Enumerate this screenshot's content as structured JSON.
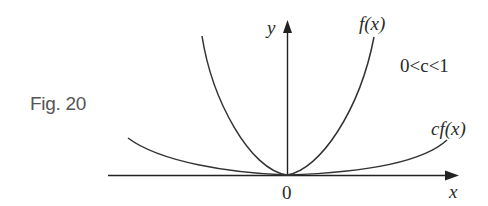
{
  "figure": {
    "label": "Fig. 20",
    "condition": "0<c<1",
    "axis_x_label": "x",
    "axis_y_label": "y",
    "origin_label": "0",
    "curve_f_label": "f(x)",
    "curve_cf_label": "cf(x)",
    "colors": {
      "curve": "#333333",
      "axis": "#222222",
      "fig_label": "#555555"
    }
  }
}
